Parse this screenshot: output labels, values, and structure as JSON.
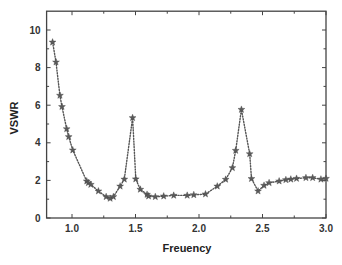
{
  "chart_data": {
    "type": "line",
    "title": "",
    "xlabel": "Freuency",
    "ylabel": "VSWR",
    "xlim": [
      0.8,
      3.0
    ],
    "ylim": [
      0,
      11
    ],
    "xticks": [
      1.0,
      1.5,
      2.0,
      2.5,
      3.0
    ],
    "xtick_labels": [
      "1.0",
      "1.5",
      "2.0",
      "2.5",
      "3.0"
    ],
    "yticks": [
      0,
      2,
      4,
      6,
      8,
      10
    ],
    "ytick_labels": [
      "0",
      "2",
      "4",
      "6",
      "8",
      "10"
    ],
    "grid": false,
    "legend": null,
    "marker": "star",
    "line_style": "dotted",
    "series": [
      {
        "name": "VSWR",
        "color": "#555555",
        "x": [
          0.847,
          0.874,
          0.905,
          0.921,
          0.958,
          0.974,
          1.006,
          1.116,
          1.129,
          1.148,
          1.208,
          1.269,
          1.3,
          1.326,
          1.379,
          1.412,
          1.477,
          1.502,
          1.538,
          1.591,
          1.603,
          1.656,
          1.722,
          1.801,
          1.907,
          1.959,
          2.051,
          2.144,
          2.21,
          2.263,
          2.289,
          2.334,
          2.399,
          2.413,
          2.465,
          2.512,
          2.552,
          2.631,
          2.684,
          2.723,
          2.768,
          2.842,
          2.895,
          2.96,
          3.0
        ],
        "y": [
          9.35,
          8.29,
          6.52,
          5.92,
          4.74,
          4.32,
          3.61,
          1.96,
          1.87,
          1.78,
          1.43,
          1.13,
          1.04,
          1.13,
          1.69,
          2.06,
          5.33,
          2.07,
          1.52,
          1.25,
          1.16,
          1.13,
          1.16,
          1.2,
          1.2,
          1.23,
          1.27,
          1.69,
          2.05,
          2.67,
          3.59,
          5.77,
          3.41,
          2.09,
          1.43,
          1.73,
          1.87,
          1.96,
          2.03,
          2.06,
          2.1,
          2.14,
          2.14,
          2.06,
          2.1
        ]
      }
    ]
  },
  "layout": {
    "plot": {
      "left": 46.6,
      "right": 326,
      "top": 11.2,
      "bottom": 218
    },
    "frame_color": "#444444"
  }
}
